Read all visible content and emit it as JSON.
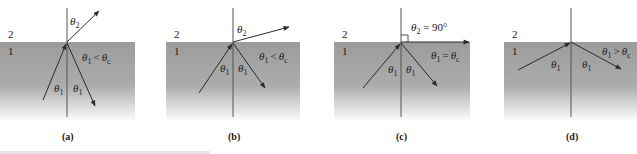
{
  "figure": {
    "colors": {
      "medium1_top": "#9a9a9a",
      "medium1_bottom": "#ffffff",
      "rays": "#2a2a2a",
      "normal": "#555555"
    },
    "medium_labels": {
      "upper": "2",
      "lower": "1"
    },
    "panels": [
      {
        "id": "a",
        "caption": "(a)",
        "condition": "θ1 < θc",
        "condition_parts": {
          "lhs": "θ",
          "lhs_sub": "1",
          "op": "<",
          "rhs": "θ",
          "rhs_sub": "c"
        },
        "angle_labels": {
          "incident": "θ1",
          "reflected": "θ1",
          "refracted": "θ2"
        },
        "description": "Partial reflection and refraction; refracted ray bends away from normal"
      },
      {
        "id": "b",
        "caption": "(b)",
        "condition": "θ1 < θc",
        "condition_parts": {
          "lhs": "θ",
          "lhs_sub": "1",
          "op": "<",
          "rhs": "θ",
          "rhs_sub": "c"
        },
        "angle_labels": {
          "incident": "θ1",
          "reflected": "θ1",
          "refracted": "θ2"
        },
        "description": "Larger incident angle; refracted ray closer to the interface"
      },
      {
        "id": "c",
        "caption": "(c)",
        "condition": "θ1 = θc",
        "condition_parts": {
          "lhs": "θ",
          "lhs_sub": "1",
          "op": "=",
          "rhs": "θ",
          "rhs_sub": "c"
        },
        "angle_labels": {
          "incident": "θ1",
          "reflected": "θ1",
          "refracted": "θ2 = 90°"
        },
        "refracted_parts": {
          "sym": "θ",
          "sub": "2",
          "rest": " = 90°"
        },
        "description": "Critical angle; refracted ray travels along the interface"
      },
      {
        "id": "d",
        "caption": "(d)",
        "condition": "θ1 > θc",
        "condition_parts": {
          "lhs": "θ",
          "lhs_sub": "1",
          "op": ">",
          "rhs": "θ",
          "rhs_sub": "c"
        },
        "angle_labels": {
          "incident": "θ1",
          "reflected": "θ1"
        },
        "description": "Total internal reflection"
      }
    ]
  }
}
